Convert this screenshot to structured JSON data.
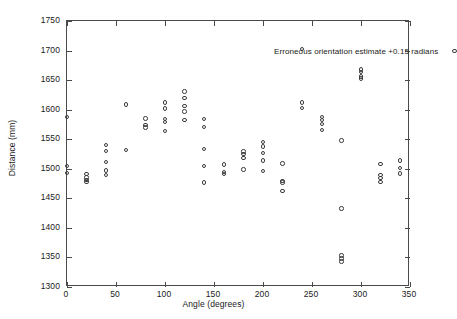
{
  "chart_data": {
    "type": "scatter",
    "title": "",
    "xlabel": "Angle (degrees)",
    "ylabel": "Distance (mm)",
    "xlim": [
      0,
      350
    ],
    "ylim": [
      1300,
      1750
    ],
    "xticks": [
      0,
      50,
      100,
      150,
      200,
      250,
      300,
      350
    ],
    "yticks": [
      1300,
      1350,
      1400,
      1450,
      1500,
      1550,
      1600,
      1650,
      1700,
      1750
    ],
    "grid": false,
    "legend_position": "top-right",
    "series": [
      {
        "name": "Erroneous orientation estimate +0.15 radians",
        "marker": "open-circle",
        "color": "#3c3c3c",
        "points": [
          [
            0,
            1588
          ],
          [
            0,
            1505
          ],
          [
            0,
            1493
          ],
          [
            20,
            1491
          ],
          [
            20,
            1485
          ],
          [
            20,
            1481
          ],
          [
            20,
            1478
          ],
          [
            40,
            1540
          ],
          [
            40,
            1530
          ],
          [
            40,
            1511
          ],
          [
            40,
            1497
          ],
          [
            40,
            1489
          ],
          [
            60,
            1609
          ],
          [
            60,
            1532
          ],
          [
            80,
            1585
          ],
          [
            80,
            1574
          ],
          [
            80,
            1570
          ],
          [
            100,
            1612
          ],
          [
            100,
            1602
          ],
          [
            100,
            1584
          ],
          [
            100,
            1579
          ],
          [
            100,
            1564
          ],
          [
            120,
            1631
          ],
          [
            120,
            1620
          ],
          [
            120,
            1606
          ],
          [
            120,
            1597
          ],
          [
            120,
            1583
          ],
          [
            140,
            1584
          ],
          [
            140,
            1571
          ],
          [
            140,
            1533
          ],
          [
            140,
            1505
          ],
          [
            140,
            1477
          ],
          [
            160,
            1507
          ],
          [
            160,
            1495
          ],
          [
            160,
            1491
          ],
          [
            180,
            1529
          ],
          [
            180,
            1525
          ],
          [
            180,
            1518
          ],
          [
            180,
            1499
          ],
          [
            200,
            1545
          ],
          [
            200,
            1538
          ],
          [
            200,
            1527
          ],
          [
            200,
            1514
          ],
          [
            200,
            1496
          ],
          [
            220,
            1509
          ],
          [
            220,
            1479
          ],
          [
            220,
            1477
          ],
          [
            220,
            1462
          ],
          [
            240,
            1703
          ],
          [
            240,
            1612
          ],
          [
            240,
            1603
          ],
          [
            260,
            1588
          ],
          [
            260,
            1582
          ],
          [
            260,
            1576
          ],
          [
            260,
            1566
          ],
          [
            280,
            1548
          ],
          [
            280,
            1433
          ],
          [
            280,
            1353
          ],
          [
            280,
            1348
          ],
          [
            280,
            1343
          ],
          [
            300,
            1668
          ],
          [
            300,
            1664
          ],
          [
            300,
            1656
          ],
          [
            300,
            1653
          ],
          [
            320,
            1508
          ],
          [
            320,
            1489
          ],
          [
            320,
            1484
          ],
          [
            320,
            1478
          ],
          [
            340,
            1514
          ],
          [
            340,
            1501
          ],
          [
            340,
            1492
          ]
        ]
      }
    ]
  },
  "legend": {
    "entries": [
      {
        "label": "Erroneous orientation estimate +0.15 radians",
        "marker": "open-circle"
      }
    ]
  },
  "axes": {
    "x_title": "Angle (degrees)",
    "y_title": "Distance (mm)",
    "x_tick_labels": [
      "0",
      "50",
      "100",
      "150",
      "200",
      "250",
      "300",
      "350"
    ],
    "y_tick_labels": [
      "1300",
      "1350",
      "1400",
      "1450",
      "1500",
      "1550",
      "1600",
      "1650",
      "1700",
      "1750"
    ]
  }
}
